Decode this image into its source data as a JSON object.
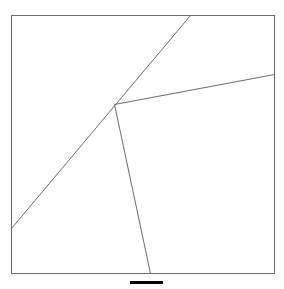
{
  "figure": {
    "title": "Grain boundary triple junction line diagram",
    "background_color": "#ffffff",
    "width": 284,
    "height": 289
  },
  "frame": {
    "name": "image-frame",
    "x": 11,
    "y": 15,
    "width": 263,
    "height": 258,
    "stroke_color": "#6b6b6b",
    "stroke_width": 1,
    "fill_color": "#ffffff"
  },
  "junction": {
    "label": "triple-junction",
    "x": 114,
    "y": 104
  },
  "lines": [
    {
      "name": "boundary-line-diagonal",
      "description": "long diagonal from lower-left edge to top edge through junction",
      "x1": 11,
      "y1": 228,
      "x2": 190,
      "y2": 15,
      "stroke_color": "#6b6b6b",
      "stroke_width": 1
    },
    {
      "name": "boundary-line-right",
      "description": "branch from junction to right edge",
      "x1": 114,
      "y1": 104,
      "x2": 274,
      "y2": 74,
      "stroke_color": "#6b6b6b",
      "stroke_width": 1
    },
    {
      "name": "boundary-line-down",
      "description": "branch from junction to bottom edge",
      "x1": 114,
      "y1": 104,
      "x2": 150,
      "y2": 273,
      "stroke_color": "#6b6b6b",
      "stroke_width": 1
    }
  ],
  "scale_bar": {
    "name": "scale-bar",
    "x": 130,
    "y": 281,
    "width": 33,
    "height": 3,
    "color": "#000000",
    "label": ""
  },
  "chart_data": {
    "type": "line",
    "title": "Grain boundary triple junction line diagram",
    "xlabel": "",
    "ylabel": "",
    "xlim": [
      11,
      274
    ],
    "ylim": [
      15,
      273
    ],
    "grid": false,
    "legend": "none",
    "annotations": [
      {
        "name": "triple-junction",
        "x": 114,
        "y": 104
      }
    ],
    "series": [
      {
        "name": "boundary-line-diagonal",
        "x": [
          11,
          190
        ],
        "y": [
          228,
          15
        ]
      },
      {
        "name": "boundary-line-right",
        "x": [
          114,
          274
        ],
        "y": [
          104,
          74
        ]
      },
      {
        "name": "boundary-line-down",
        "x": [
          114,
          150
        ],
        "y": [
          104,
          273
        ]
      }
    ]
  }
}
